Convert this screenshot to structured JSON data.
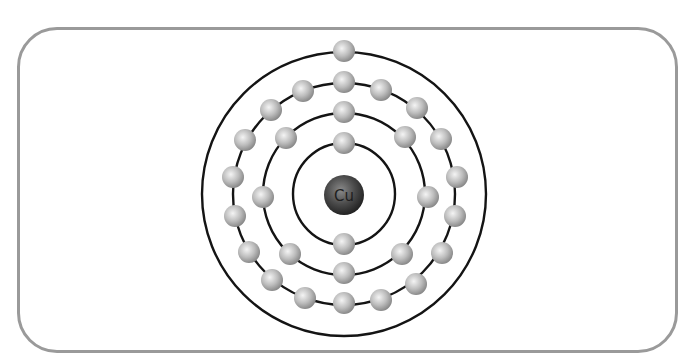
{
  "diagram": {
    "element_symbol": "Cu",
    "center": [
      344,
      194
    ],
    "nucleus": {
      "label": "Cu",
      "radius": 20,
      "color_dark": "#2a2a2a",
      "color_light": "#8a8a8a"
    },
    "electron_radius": 11,
    "electron_color_light": "#f2f2f2",
    "electron_color_dark": "#8c8c8c",
    "shell_stroke": "#141414",
    "shells": [
      {
        "name": "shell-1",
        "radius": 51,
        "electron_count": 2,
        "electrons": [
          [
            344,
            143
          ],
          [
            344,
            244
          ]
        ]
      },
      {
        "name": "shell-2",
        "radius": 81,
        "electron_count": 8,
        "electrons": [
          [
            344,
            112
          ],
          [
            405,
            137
          ],
          [
            428,
            197
          ],
          [
            402,
            254
          ],
          [
            344,
            273
          ],
          [
            290,
            254
          ],
          [
            263,
            197
          ],
          [
            286,
            138
          ]
        ]
      },
      {
        "name": "shell-3",
        "radius": 111,
        "electron_count": 18,
        "electrons": [
          [
            344,
            82
          ],
          [
            381,
            90
          ],
          [
            417,
            108
          ],
          [
            441,
            139
          ],
          [
            457,
            177
          ],
          [
            455,
            216
          ],
          [
            442,
            253
          ],
          [
            416,
            284
          ],
          [
            381,
            300
          ],
          [
            344,
            303
          ],
          [
            305,
            298
          ],
          [
            272,
            280
          ],
          [
            249,
            252
          ],
          [
            235,
            216
          ],
          [
            233,
            177
          ],
          [
            245,
            140
          ],
          [
            271,
            110
          ],
          [
            303,
            91
          ]
        ]
      },
      {
        "name": "shell-4",
        "radius": 142,
        "electron_count": 1,
        "electrons": [
          [
            344,
            51
          ]
        ]
      }
    ],
    "frame": {
      "border_color": "#9a9a9a",
      "corner_radius": 40
    }
  }
}
